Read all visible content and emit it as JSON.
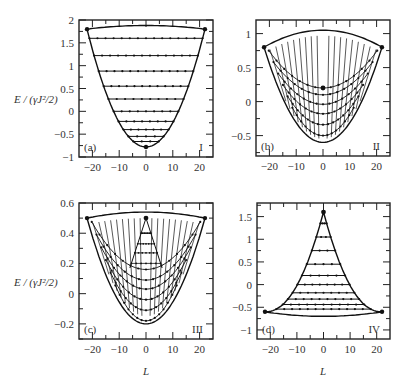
{
  "figure": {
    "ylabel": "E / (γJ²/2)",
    "xlabel": "L",
    "panels": [
      {
        "id": "a",
        "tag": "(a)",
        "region": "I",
        "yticks": [
          "2",
          "1.5",
          "1",
          "0.5",
          "0",
          "−0.5",
          "−1"
        ],
        "xticks": [
          "−20",
          "−10",
          "0",
          "10",
          "20"
        ]
      },
      {
        "id": "b",
        "tag": "(b)",
        "region": "II",
        "yticks": [
          "1",
          "0.5",
          "0",
          "−0.5"
        ],
        "xticks": [
          "−20",
          "−10",
          "0",
          "10",
          "20"
        ]
      },
      {
        "id": "c",
        "tag": "(c)",
        "region": "III",
        "yticks": [
          "0.6",
          "0.4",
          "0.2",
          "0",
          "−0.2"
        ],
        "xticks": [
          "−20",
          "−10",
          "0",
          "10",
          "20"
        ]
      },
      {
        "id": "d",
        "tag": "(d)",
        "region": "IV",
        "yticks": [
          "1.5",
          "1",
          "0.5",
          "0",
          "−0.5",
          "−1"
        ],
        "xticks": [
          "−20",
          "−10",
          "0",
          "10",
          "20"
        ]
      }
    ]
  },
  "chart_data": [
    {
      "type": "scatter",
      "title": "(a) I",
      "xlabel": "L",
      "ylabel": "E/(γJ²/2)",
      "xlim": [
        -25,
        25
      ],
      "ylim": [
        -1,
        2
      ],
      "boundary": {
        "lower_parabola_min": [
          0,
          -0.78
        ],
        "corners": [
          [
            -22,
            1.8
          ],
          [
            22,
            1.8
          ]
        ],
        "top_arc_peak": [
          0,
          1.88
        ]
      },
      "levels_E": [
        1.6,
        1.22,
        0.88,
        0.55,
        0.27,
        0.0,
        -0.22,
        -0.4,
        -0.55,
        -0.66
      ],
      "grid": false
    },
    {
      "type": "scatter",
      "title": "(b) II",
      "xlabel": "L",
      "ylabel": "",
      "xlim": [
        -25,
        25
      ],
      "ylim": [
        -0.8,
        1.2
      ],
      "boundary": {
        "lower_parabola_min": [
          0,
          -0.6
        ],
        "corners": [
          [
            -22,
            0.8
          ],
          [
            22,
            0.8
          ]
        ],
        "top_arc_peak": [
          0,
          1.05
        ],
        "center_point": [
          0,
          0.2
        ]
      },
      "level_minima_E": [
        0.2,
        0.1,
        -0.04,
        -0.18,
        -0.34,
        -0.5
      ],
      "grid": false
    },
    {
      "type": "scatter",
      "title": "(c) III",
      "xlabel": "L",
      "ylabel": "E/(γJ²/2)",
      "xlim": [
        -25,
        25
      ],
      "ylim": [
        -0.3,
        0.6
      ],
      "boundary": {
        "lower_parabola_min": [
          0,
          -0.2
        ],
        "corners": [
          [
            -22,
            0.5
          ],
          [
            22,
            0.5
          ]
        ],
        "top_arc_peak": [
          0,
          0.54
        ],
        "apex": [
          0,
          0.5
        ]
      },
      "level_minima_E": [
        0.16,
        0.09,
        0.03,
        -0.04,
        -0.11,
        -0.18
      ],
      "grid": false
    },
    {
      "type": "scatter",
      "title": "(d) IV",
      "xlabel": "L",
      "ylabel": "",
      "xlim": [
        -25,
        25
      ],
      "ylim": [
        -1.2,
        1.8
      ],
      "boundary": {
        "apex": [
          0,
          1.6
        ],
        "corners": [
          [
            -22,
            -0.6
          ],
          [
            22,
            -0.6
          ]
        ],
        "bottom_arc_min": [
          0,
          -0.7
        ]
      },
      "levels_E": [
        1.35,
        1.05,
        0.75,
        0.45,
        0.2,
        0.0,
        -0.18,
        -0.32,
        -0.44,
        -0.54
      ],
      "grid": false
    }
  ]
}
